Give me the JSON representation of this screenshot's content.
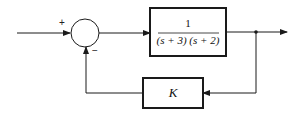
{
  "diagram": {
    "type": "feedback-control-block-diagram",
    "summing_junction": {
      "input_sign": "+",
      "feedback_sign": "−"
    },
    "forward_block": {
      "numerator": "1",
      "denominator": "(s + 3) (s + 2)"
    },
    "feedback_block": {
      "label": "K"
    },
    "colors": {
      "line": "#1a1a1a",
      "background": "#ffffff"
    }
  }
}
